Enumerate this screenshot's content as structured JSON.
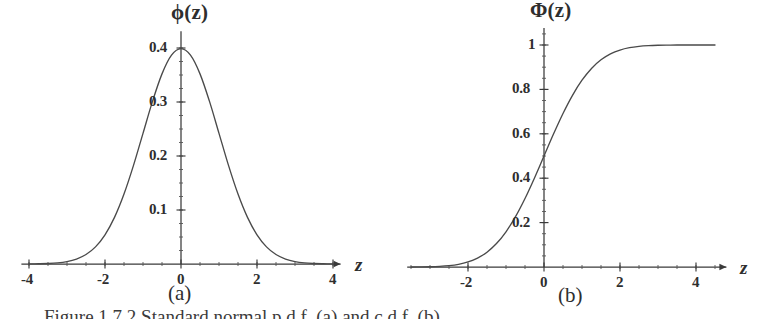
{
  "figure": {
    "caption": "Figure 1.7.2  Standard normal p.d.f. (a) and c.d.f. (b).",
    "background_color": "#ffffff",
    "ink_color": "#3a3a3a"
  },
  "panels": [
    {
      "id": "a",
      "sublabel": "(a)",
      "title": "ϕ(z)",
      "xlabel": "z",
      "x_ticks": [
        "-4",
        "-2",
        "0",
        "2",
        "4"
      ],
      "y_ticks": [
        "0.1",
        "0.2",
        "0.3",
        "0.4"
      ]
    },
    {
      "id": "b",
      "sublabel": "(b)",
      "title": "Φ(z)",
      "xlabel": "z",
      "x_ticks": [
        "-2",
        "0",
        "2",
        "4"
      ],
      "y_ticks": [
        "0.2",
        "0.4",
        "0.6",
        "0.8",
        "1"
      ]
    }
  ],
  "chart_data": [
    {
      "type": "line",
      "title": "ϕ(z)",
      "subtitle": "(a)",
      "xlabel": "z",
      "ylabel": "ϕ(z)",
      "xlim": [
        -4.2,
        4.2
      ],
      "ylim": [
        0,
        0.42
      ],
      "grid": false,
      "legend": null,
      "xticks": [
        -4,
        -2,
        0,
        2,
        4
      ],
      "xticklabels": [
        "-4",
        "-2",
        "0",
        "2",
        "4"
      ],
      "yticks": [
        0.1,
        0.2,
        0.3,
        0.4
      ],
      "yticklabels": [
        "0.1",
        "0.2",
        "0.3",
        "0.4"
      ],
      "x_minor_tick_step": 0.5,
      "y_minor_tick_step": 0.025,
      "series": [
        {
          "name": "standard normal pdf",
          "formula": "phi(z) = exp(-z^2/2)/sqrt(2*pi)",
          "x": [
            -4.0,
            -3.75,
            -3.5,
            -3.25,
            -3.0,
            -2.75,
            -2.5,
            -2.25,
            -2.0,
            -1.75,
            -1.5,
            -1.25,
            -1.0,
            -0.75,
            -0.5,
            -0.25,
            0.0,
            0.25,
            0.5,
            0.75,
            1.0,
            1.25,
            1.5,
            1.75,
            2.0,
            2.25,
            2.5,
            2.75,
            3.0,
            3.25,
            3.5,
            3.75,
            4.0
          ],
          "y": [
            0.0001,
            0.0004,
            0.0009,
            0.002,
            0.0044,
            0.0091,
            0.0175,
            0.0317,
            0.054,
            0.0863,
            0.1295,
            0.1826,
            0.242,
            0.3011,
            0.3521,
            0.3867,
            0.3989,
            0.3867,
            0.3521,
            0.3011,
            0.242,
            0.1826,
            0.1295,
            0.0863,
            0.054,
            0.0317,
            0.0175,
            0.0091,
            0.0044,
            0.002,
            0.0009,
            0.0004,
            0.0001
          ]
        }
      ],
      "annotations": [
        {
          "text": "peak value 0.3989 at z = 0"
        }
      ]
    },
    {
      "type": "line",
      "title": "Φ(z)",
      "subtitle": "(b)",
      "xlabel": "z",
      "ylabel": "Φ(z)",
      "xlim": [
        -3.6,
        4.8
      ],
      "ylim": [
        0,
        1.05
      ],
      "grid": false,
      "legend": null,
      "xticks": [
        -2,
        0,
        2,
        4
      ],
      "xticklabels": [
        "-2",
        "0",
        "2",
        "4"
      ],
      "yticks": [
        0.2,
        0.4,
        0.6,
        0.8,
        1.0
      ],
      "yticklabels": [
        "0.2",
        "0.4",
        "0.6",
        "0.8",
        "1"
      ],
      "x_minor_tick_step": 0.5,
      "y_minor_tick_step": 0.05,
      "series": [
        {
          "name": "standard normal cdf",
          "formula": "Phi(z) = integral of phi from -inf to z",
          "x": [
            -3.5,
            -3.25,
            -3.0,
            -2.75,
            -2.5,
            -2.25,
            -2.0,
            -1.75,
            -1.5,
            -1.25,
            -1.0,
            -0.75,
            -0.5,
            -0.25,
            0.0,
            0.25,
            0.5,
            0.75,
            1.0,
            1.25,
            1.5,
            1.75,
            2.0,
            2.25,
            2.5,
            2.75,
            3.0,
            3.25,
            3.5,
            4.0,
            4.5
          ],
          "y": [
            0.0002,
            0.0006,
            0.0013,
            0.003,
            0.0062,
            0.0122,
            0.0228,
            0.0401,
            0.0668,
            0.1056,
            0.1587,
            0.2266,
            0.3085,
            0.4013,
            0.5,
            0.5987,
            0.6915,
            0.7734,
            0.8413,
            0.8944,
            0.9332,
            0.9599,
            0.9772,
            0.9878,
            0.9938,
            0.997,
            0.9987,
            0.9994,
            0.9998,
            1.0,
            1.0
          ]
        }
      ],
      "annotations": [
        {
          "text": "value 0.5 at z = 0"
        },
        {
          "text": "asymptote at 1"
        }
      ]
    }
  ]
}
